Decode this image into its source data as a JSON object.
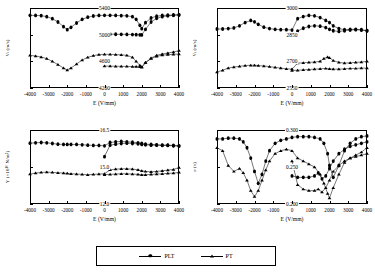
{
  "legend": {
    "entries": [
      {
        "label": "PLT",
        "marker": "filled-circle"
      },
      {
        "label": "PT",
        "marker": "filled-triangle"
      }
    ]
  },
  "axis": {
    "xlabel": "E (V/mm)",
    "xticks": [
      "-4000",
      "-3000",
      "-2000",
      "-1000",
      "0",
      "1000",
      "2000",
      "3000",
      "4000"
    ],
    "xlim": [
      -4000,
      4000
    ]
  },
  "chart_data": [
    {
      "type": "line",
      "panel": "top-left",
      "title": "",
      "xlabel": "E (V/mm)",
      "ylabel": "Vₗ (m/s)",
      "xlim": [
        -4000,
        4000
      ],
      "ylim": [
        4200,
        5400
      ],
      "yticks": [
        "5400",
        "5000",
        "4600",
        "4200"
      ],
      "grid": false,
      "series": [
        {
          "name": "PLT",
          "marker": "filled-circle",
          "x": [
            -4000,
            -3700,
            -3400,
            -3100,
            -2800,
            -2500,
            -2200,
            -2000,
            -1800,
            -1500,
            -1200,
            -900,
            -600,
            -300,
            0,
            300,
            600,
            900,
            1200,
            1500,
            1700,
            1900,
            2000,
            2200,
            2500,
            2800,
            3100,
            3400,
            3700,
            4000
          ],
          "y": [
            5290,
            5288,
            5285,
            5270,
            5240,
            5190,
            5120,
            5075,
            5110,
            5175,
            5230,
            5262,
            5280,
            5288,
            5290,
            5290,
            5288,
            5285,
            5282,
            5270,
            5230,
            5140,
            5090,
            5180,
            5250,
            5278,
            5288,
            5292,
            5295,
            5298
          ]
        },
        {
          "name": "PLT-return",
          "marker": "filled-circle",
          "x": [
            0,
            300,
            600,
            900,
            1200,
            1500,
            1700,
            1900,
            2000,
            2200,
            2500,
            2800,
            3100,
            3400,
            3700,
            4000
          ],
          "y": [
            5010,
            5008,
            5006,
            5005,
            5004,
            5002,
            5000,
            4998,
            4996,
            5080,
            5190,
            5245,
            5270,
            5282,
            5290,
            5296
          ]
        },
        {
          "name": "PT",
          "marker": "filled-triangle",
          "x": [
            -4000,
            -3700,
            -3400,
            -3100,
            -2800,
            -2500,
            -2200,
            -2000,
            -1800,
            -1500,
            -1200,
            -900,
            -600,
            -300,
            0,
            300,
            600,
            900,
            1200,
            1500,
            1700,
            1900,
            2000,
            2200,
            2500,
            2800,
            3100,
            3400,
            3700,
            4000
          ],
          "y": [
            4690,
            4680,
            4665,
            4640,
            4600,
            4550,
            4500,
            4470,
            4500,
            4560,
            4620,
            4660,
            4685,
            4700,
            4705,
            4705,
            4702,
            4698,
            4690,
            4660,
            4600,
            4540,
            4510,
            4580,
            4650,
            4690,
            4710,
            4725,
            4740,
            4760
          ]
        },
        {
          "name": "PT-return",
          "marker": "filled-triangle",
          "x": [
            0,
            300,
            600,
            900,
            1200,
            1500,
            1700,
            1900,
            2000,
            2200,
            2500,
            2800,
            3100,
            3400,
            3700,
            4000
          ],
          "y": [
            4530,
            4528,
            4526,
            4525,
            4524,
            4522,
            4520,
            4518,
            4516,
            4580,
            4640,
            4675,
            4692,
            4700,
            4705,
            4710
          ]
        }
      ]
    },
    {
      "type": "line",
      "panel": "top-right",
      "title": "",
      "xlabel": "E (V/mm)",
      "ylabel": "Vₜ (m/s)",
      "xlim": [
        -4000,
        4000
      ],
      "ylim": [
        2550,
        3000
      ],
      "yticks": [
        "3000",
        "2850",
        "2700",
        "2550"
      ],
      "grid": false,
      "series": [
        {
          "name": "PLT",
          "marker": "filled-circle",
          "x": [
            -4000,
            -3700,
            -3400,
            -3100,
            -2800,
            -2500,
            -2200,
            -2000,
            -1800,
            -1500,
            -1200,
            -900,
            -600,
            -300,
            0,
            300,
            600,
            900,
            1200,
            1500,
            1800,
            2000,
            2200,
            2500,
            2800,
            3100,
            3400,
            3700,
            4000
          ],
          "y": [
            2882,
            2882,
            2884,
            2888,
            2900,
            2918,
            2930,
            2922,
            2908,
            2892,
            2884,
            2880,
            2878,
            2878,
            2876,
            2940,
            2952,
            2958,
            2956,
            2946,
            2930,
            2918,
            2900,
            2884,
            2878,
            2880,
            2880,
            2878,
            2872
          ]
        },
        {
          "name": "PLT-return",
          "marker": "filled-circle",
          "x": [
            0,
            300,
            600,
            900,
            1200,
            1500,
            1800,
            2000,
            2200,
            2500,
            2800,
            3100,
            3400,
            3700,
            4000
          ],
          "y": [
            2848,
            2870,
            2886,
            2896,
            2900,
            2898,
            2890,
            2880,
            2872,
            2868,
            2872,
            2876,
            2878,
            2876,
            2872
          ]
        },
        {
          "name": "PT",
          "marker": "filled-triangle",
          "x": [
            -4000,
            -3700,
            -3400,
            -3100,
            -2800,
            -2500,
            -2200,
            -2000,
            -1800,
            -1500,
            -1200,
            -900,
            -600,
            -300,
            0,
            300,
            600,
            900,
            1200,
            1500,
            1700,
            1900,
            2000,
            2200,
            2500,
            2800,
            3100,
            3400,
            3700,
            4000
          ],
          "y": [
            2640,
            2650,
            2662,
            2668,
            2672,
            2676,
            2678,
            2678,
            2676,
            2674,
            2670,
            2666,
            2662,
            2658,
            2656,
            2690,
            2692,
            2694,
            2696,
            2700,
            2716,
            2724,
            2720,
            2704,
            2694,
            2690,
            2692,
            2694,
            2696,
            2700
          ]
        },
        {
          "name": "PT-return",
          "marker": "filled-triangle",
          "x": [
            0,
            300,
            600,
            900,
            1200,
            1500,
            1800,
            2000,
            2200,
            2500,
            2800,
            3100,
            3400,
            3700,
            4000
          ],
          "y": [
            2648,
            2650,
            2652,
            2654,
            2656,
            2658,
            2660,
            2658,
            2656,
            2656,
            2658,
            2660,
            2660,
            2662,
            2662
          ]
        }
      ]
    },
    {
      "type": "line",
      "panel": "bottom-left",
      "title": "",
      "xlabel": "E (V/mm)",
      "ylabel": "Y (×10¹⁰ N/m²)",
      "xlim": [
        -4000,
        4000
      ],
      "ylim": [
        12.0,
        16.5
      ],
      "yticks": [
        "16.5",
        "15.0",
        "12.0"
      ],
      "grid": false,
      "series": [
        {
          "name": "PLT",
          "marker": "filled-circle",
          "x": [
            -4000,
            -3700,
            -3400,
            -3100,
            -2800,
            -2500,
            -2200,
            -2000,
            -1800,
            -1500,
            -1200,
            -900,
            -600,
            -300,
            0,
            300,
            600,
            900,
            1200,
            1500,
            1800,
            2000,
            2200,
            2500,
            2800,
            3100,
            3400,
            3700,
            4000
          ],
          "y": [
            15.7,
            15.72,
            15.74,
            15.72,
            15.68,
            15.64,
            15.62,
            15.62,
            15.62,
            15.62,
            15.6,
            15.58,
            15.56,
            15.56,
            15.54,
            15.74,
            15.78,
            15.8,
            15.78,
            15.76,
            15.72,
            15.68,
            15.64,
            15.62,
            15.6,
            15.58,
            15.58,
            15.56,
            15.54
          ]
        },
        {
          "name": "PLT-return",
          "marker": "filled-circle",
          "x": [
            0,
            300,
            600,
            900,
            1200,
            1500,
            1800,
            2000,
            2200,
            2500,
            2800,
            3100,
            3400,
            3700,
            4000
          ],
          "y": [
            14.88,
            15.58,
            15.64,
            15.68,
            15.7,
            15.68,
            15.66,
            15.62,
            15.6,
            15.58,
            15.58,
            15.56,
            15.56,
            15.54,
            15.52
          ]
        },
        {
          "name": "PT",
          "marker": "filled-triangle",
          "x": [
            -4000,
            -3700,
            -3400,
            -3100,
            -2800,
            -2500,
            -2200,
            -2000,
            -1800,
            -1500,
            -1200,
            -900,
            -600,
            -300,
            0,
            300,
            600,
            900,
            1200,
            1500,
            1800,
            2000,
            2200,
            2500,
            2800,
            3100,
            3400,
            3700,
            4000
          ],
          "y": [
            13.82,
            13.88,
            13.92,
            13.94,
            13.92,
            13.9,
            13.88,
            13.86,
            13.84,
            13.82,
            13.8,
            13.78,
            13.8,
            13.82,
            13.84,
            14.08,
            14.12,
            14.14,
            14.14,
            14.12,
            14.08,
            14.02,
            13.98,
            13.96,
            13.98,
            14.02,
            14.06,
            14.1,
            14.22
          ]
        },
        {
          "name": "PT-return",
          "marker": "filled-triangle",
          "x": [
            0,
            300,
            600,
            900,
            1200,
            1500,
            1800,
            2000,
            2200,
            2500,
            2800,
            3100,
            3400,
            3700,
            4000
          ],
          "y": [
            13.78,
            13.8,
            13.82,
            13.84,
            13.84,
            13.82,
            13.8,
            13.78,
            13.78,
            13.8,
            13.82,
            13.84,
            13.86,
            13.88,
            13.92
          ]
        }
      ]
    },
    {
      "type": "line",
      "panel": "bottom-right",
      "title": "",
      "xlabel": "E (V/mm)",
      "ylabel": "σ (ν)",
      "xlim": [
        -4000,
        4000
      ],
      "ylim": [
        0.2,
        0.3
      ],
      "yticks": [
        "0.300",
        "0.250",
        "0.200"
      ],
      "grid": false,
      "series": [
        {
          "name": "PLT",
          "marker": "filled-circle",
          "x": [
            -4000,
            -3700,
            -3400,
            -3100,
            -2800,
            -2600,
            -2400,
            -2200,
            -2000,
            -1800,
            -1600,
            -1400,
            -1200,
            -900,
            -600,
            -300,
            0,
            300,
            600,
            900,
            1200,
            1500,
            1700,
            1900,
            2000,
            2200,
            2500,
            2800,
            3100,
            3400,
            3700,
            4000
          ],
          "y": [
            0.288,
            0.288,
            0.289,
            0.289,
            0.288,
            0.284,
            0.276,
            0.262,
            0.244,
            0.228,
            0.24,
            0.258,
            0.272,
            0.282,
            0.286,
            0.288,
            0.29,
            0.291,
            0.291,
            0.291,
            0.29,
            0.288,
            0.282,
            0.268,
            0.252,
            0.236,
            0.252,
            0.272,
            0.282,
            0.288,
            0.291,
            0.292
          ]
        },
        {
          "name": "PLT-return",
          "marker": "filled-circle",
          "x": [
            0,
            300,
            600,
            900,
            1200,
            1400,
            1600,
            1800,
            2000,
            2200,
            2500,
            2800,
            3100,
            3400,
            3700,
            4000
          ],
          "y": [
            0.238,
            0.236,
            0.236,
            0.236,
            0.238,
            0.242,
            0.234,
            0.238,
            0.248,
            0.258,
            0.268,
            0.274,
            0.278,
            0.28,
            0.282,
            0.284
          ]
        },
        {
          "name": "PT",
          "marker": "filled-triangle",
          "x": [
            -4000,
            -3700,
            -3400,
            -3100,
            -2800,
            -2600,
            -2400,
            -2200,
            -2000,
            -1800,
            -1600,
            -1400,
            -1200,
            -900,
            -600,
            -300,
            0,
            300,
            600,
            900,
            1200,
            1500,
            1700,
            1900,
            2000,
            2200,
            2500,
            2800,
            3100,
            3400,
            3700,
            4000
          ],
          "y": [
            0.276,
            0.272,
            0.252,
            0.244,
            0.248,
            0.242,
            0.232,
            0.218,
            0.21,
            0.218,
            0.232,
            0.246,
            0.258,
            0.268,
            0.272,
            0.274,
            0.272,
            0.262,
            0.258,
            0.254,
            0.25,
            0.24,
            0.228,
            0.214,
            0.208,
            0.222,
            0.24,
            0.256,
            0.262,
            0.266,
            0.27,
            0.276
          ]
        },
        {
          "name": "PT-return",
          "marker": "filled-triangle",
          "x": [
            0,
            300,
            600,
            900,
            1200,
            1400,
            1600,
            1800,
            2000,
            2200,
            2500,
            2800,
            3100,
            3400,
            3700,
            4000
          ],
          "y": [
            0.258,
            0.226,
            0.22,
            0.218,
            0.218,
            0.22,
            0.216,
            0.222,
            0.232,
            0.244,
            0.252,
            0.258,
            0.262,
            0.264,
            0.266,
            0.268
          ]
        }
      ]
    }
  ]
}
